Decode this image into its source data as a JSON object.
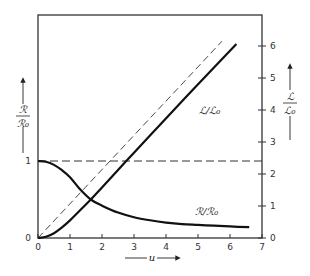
{
  "chart_data": {
    "type": "line",
    "title": "",
    "xlabel": "u",
    "ylabel_left": "ℛ/ℛ₀",
    "ylabel_right": "ℒ/ℒ₀",
    "xlim": [
      0,
      7
    ],
    "ylim_left": [
      0,
      1.0
    ],
    "ylim_right": [
      0,
      6.5
    ],
    "x_ticks": [
      "0",
      "1",
      "2",
      "3",
      "4",
      "5",
      "6",
      "7"
    ],
    "y_ticks_left": [
      "0",
      "1"
    ],
    "y_ticks_right": [
      "0",
      "1",
      "2",
      "3",
      "4",
      "5",
      "6"
    ],
    "grid": false,
    "series": [
      {
        "name": "ℛ/ℛ₀",
        "axis": "left",
        "style": "solid",
        "x": [
          0,
          0.25,
          0.5,
          0.75,
          1.0,
          1.3,
          1.65,
          2.0,
          2.5,
          3.0,
          3.5,
          4.0,
          4.5,
          5.0,
          5.5,
          6.0,
          6.6
        ],
        "y": [
          1.0,
          0.99,
          0.95,
          0.88,
          0.79,
          0.64,
          0.5,
          0.42,
          0.33,
          0.27,
          0.23,
          0.2,
          0.18,
          0.17,
          0.16,
          0.15,
          0.14
        ]
      },
      {
        "name": "ℒ/ℒ₀",
        "axis": "right",
        "style": "solid",
        "x": [
          0,
          0.25,
          0.5,
          0.75,
          1.0,
          1.3,
          1.65,
          2.0,
          2.75,
          3.5,
          4.5,
          5.5,
          6.2
        ],
        "y": [
          0,
          0.04,
          0.15,
          0.33,
          0.55,
          0.85,
          1.2,
          1.58,
          2.4,
          3.2,
          4.27,
          5.33,
          6.06
        ]
      },
      {
        "name": "asymptote (ℒ/ℒ₀ ∝ u)",
        "axis": "right",
        "style": "dashed",
        "x": [
          0,
          5.75
        ],
        "y": [
          0,
          6.15
        ]
      },
      {
        "name": "ℛ/ℛ₀ = 1 reference",
        "axis": "left",
        "style": "dashed",
        "x": [
          0,
          7
        ],
        "y": [
          1,
          1
        ]
      }
    ],
    "annotations": [
      {
        "text": "ℒ/ℒ₀",
        "near_u": 5.0,
        "near_value_right": 3.9
      },
      {
        "text": "ℛ/ℛ₀",
        "near_u": 4.8,
        "near_value_left": 0.36
      }
    ]
  },
  "labels": {
    "x_axis": "u",
    "left_num": "ℛ",
    "left_den": "ℛ₀",
    "right_num": "ℒ",
    "right_den": "ℒ₀",
    "curve_L": "ℒ/ℒ₀",
    "curve_R": "ℛ/ℛ₀",
    "left_tick_0": "0",
    "left_tick_1": "1",
    "x_ticks": [
      "0",
      "1",
      "2",
      "3",
      "4",
      "5",
      "6",
      "7"
    ],
    "right_ticks": [
      "0",
      "1",
      "2",
      "3",
      "4",
      "5",
      "6"
    ]
  }
}
